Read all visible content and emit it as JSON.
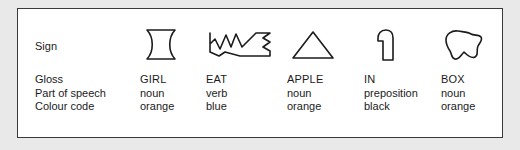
{
  "figure": {
    "row_labels": {
      "sign": "Sign",
      "gloss": "Gloss",
      "part_of_speech": "Part of speech",
      "colour_code": "Colour code"
    },
    "columns": [
      {
        "sign_icon": "hourglass-sign-icon",
        "gloss": "GIRL",
        "part_of_speech": "noun",
        "colour_code": "orange"
      },
      {
        "sign_icon": "zigzag-sign-icon",
        "gloss": "EAT",
        "part_of_speech": "verb",
        "colour_code": "blue"
      },
      {
        "sign_icon": "triangle-sign-icon",
        "gloss": "APPLE",
        "part_of_speech": "noun",
        "colour_code": "orange"
      },
      {
        "sign_icon": "rounded-post-sign-icon",
        "gloss": "IN",
        "part_of_speech": "preposition",
        "colour_code": "black"
      },
      {
        "sign_icon": "blob-sign-icon",
        "gloss": "BOX",
        "part_of_speech": "noun",
        "colour_code": "orange"
      }
    ],
    "colors": {
      "ink": "#1b1b1b",
      "frame": "#3a3a3a",
      "page": "#e9e9e9",
      "panel": "#ffffff"
    }
  }
}
